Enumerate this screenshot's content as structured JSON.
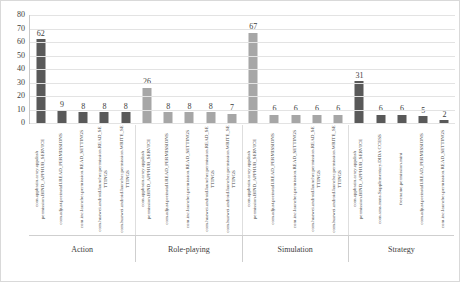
{
  "chart_data": {
    "type": "bar",
    "title": "",
    "xlabel": "",
    "ylabel": "",
    "ylim": [
      0,
      80
    ],
    "yticks": [
      0,
      10,
      20,
      30,
      40,
      50,
      60,
      70,
      80
    ],
    "grid": true,
    "legend": "none",
    "bar_colors": {
      "dark": "#595959",
      "light": "#a6a6a6"
    },
    "groups": [
      {
        "name": "Action",
        "color": "dark",
        "categories": [
          "com.appbrain.array.appdash permission.BIND_APPHUB_SERVICE",
          "com.adjust.preinstall.READ_PERMISSIONS",
          "com.inc.launcher.permission.READ_SETTINGS",
          "com.huawei.android.launcher.permission.READ_SETTINGS",
          "com.huawei.android.launcher.permission.WRITE_SETTINGS"
        ],
        "values": [
          62,
          9,
          8,
          8,
          8
        ]
      },
      {
        "name": "Role-playing",
        "color": "light",
        "categories": [
          "com.appbrain.array.appdash permission.BIND_APPHUB_SERVICE",
          "com.adjust.preinstall.READ_PERMISSIONS",
          "com.inc.launcher.permission.READ_SETTINGS",
          "com.huawei.android.launcher.permission.READ_SETTINGS",
          "com.huawei.android.launcher.permission.WRITE_SETTINGS",
          "com.mdown.launcher.permission.U PDATE_COUNT"
        ],
        "values": [
          26,
          8,
          8,
          8,
          7
        ]
      },
      {
        "name": "Simulation",
        "color": "light",
        "categories": [
          "com.appbrain.array.appdash permission.BIND_APPHUB_SERVICE",
          "com.adjust.preinstall.READ_PERMISSIONS",
          "com.inc.launcher.permission.READ_SETTINGS",
          "com.huawei.android.launcher.permission.READ_SETTINGS",
          "com.huawei.android.launcher.permission.WRITE_SETTINGS",
          "com.mdown.launcher.permission.U PDATE_COUNT"
        ],
        "values": [
          67,
          6,
          6,
          6,
          6
        ]
      },
      {
        "name": "Strategy",
        "color": "dark",
        "categories": [
          "com.appbrain.array.appdash permission.BIND_APPHUB_SERVICE",
          "com.sms.mms.Supplementary.DIDA CCESS",
          "freename.permission.mini",
          "com.adjust.preinstall.READ_PERMISSIONS",
          "com.inc.launcher.permission.READ_SETTINGS"
        ],
        "values": [
          31,
          6,
          6,
          5,
          2
        ]
      }
    ]
  }
}
